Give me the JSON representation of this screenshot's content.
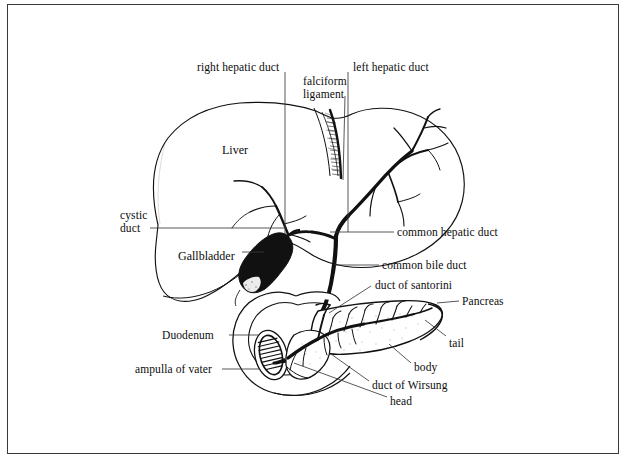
{
  "figure": {
    "border_color": "#3a3a3a",
    "background_color": "#ffffff",
    "ink_color": "#0c0c0c"
  },
  "organ_labels": [
    {
      "id": "liver",
      "text": "Liver",
      "x": 222,
      "y": 143
    },
    {
      "id": "gallbladder",
      "text": "Gallbladder",
      "x": 178,
      "y": 255
    }
  ],
  "annotations": [
    {
      "id": "right-hepatic-duct",
      "text": "right hepatic duct",
      "x": 197,
      "y": 61
    },
    {
      "id": "falciform-ligament-line1",
      "text": "falciform",
      "x": 303,
      "y": 75
    },
    {
      "id": "falciform-ligament-line2",
      "text": "ligament",
      "x": 303,
      "y": 88
    },
    {
      "id": "left-hepatic-duct",
      "text": "left hepatic duct",
      "x": 353,
      "y": 61
    },
    {
      "id": "cystic-duct-line1",
      "text": "cystic",
      "x": 120,
      "y": 209
    },
    {
      "id": "cystic-duct-line2",
      "text": "duct",
      "x": 120,
      "y": 222
    },
    {
      "id": "common-hepatic-duct",
      "text": "common hepatic duct",
      "x": 397,
      "y": 228
    },
    {
      "id": "common-bile-duct",
      "text": "common bile duct",
      "x": 382,
      "y": 261
    },
    {
      "id": "duct-of-santorini",
      "text": "duct of santorini",
      "x": 375,
      "y": 281
    },
    {
      "id": "pancreas",
      "text": "Pancreas",
      "x": 462,
      "y": 297
    },
    {
      "id": "duodenum",
      "text": "Duodenum",
      "x": 162,
      "y": 331
    },
    {
      "id": "tail",
      "text": "tail",
      "x": 449,
      "y": 339
    },
    {
      "id": "ampulla-of-vater",
      "text": "ampulla of vater",
      "x": 135,
      "y": 365
    },
    {
      "id": "body",
      "text": "body",
      "x": 414,
      "y": 368
    },
    {
      "id": "duct-of-wirsung",
      "text": "duct of Wirsung",
      "x": 372,
      "y": 385
    },
    {
      "id": "head",
      "text": "head",
      "x": 390,
      "y": 401
    }
  ],
  "structures": [
    "liver-outline",
    "falciform-ligament",
    "right-hepatic-duct",
    "left-hepatic-duct",
    "common-hepatic-duct",
    "cystic-duct",
    "gallbladder",
    "common-bile-duct",
    "duodenum",
    "ampulla-of-vater",
    "pancreas-head",
    "pancreas-body",
    "pancreas-tail",
    "duct-of-wirsung",
    "duct-of-santorini",
    "intrahepatic-biliary-tree"
  ],
  "leader_lines": [
    {
      "id": "right-hepatic-duct-leader",
      "x1": 285,
      "y1": 70,
      "x2": 285,
      "y2": 232
    },
    {
      "id": "falciform-ligament-leader",
      "x1": 345,
      "y1": 96,
      "x2": 345,
      "y2": 182
    },
    {
      "id": "left-hepatic-duct-leader",
      "x1": 348,
      "y1": 70,
      "x2": 348,
      "y2": 230
    },
    {
      "id": "cystic-duct-leader",
      "x1": 150,
      "y1": 228,
      "x2": 283,
      "y2": 228
    },
    {
      "id": "common-hepatic-duct-leader",
      "x1": 393,
      "y1": 232,
      "x2": 330,
      "y2": 232
    },
    {
      "id": "common-bile-duct-leader",
      "x1": 378,
      "y1": 265,
      "x2": 333,
      "y2": 265
    },
    {
      "id": "duct-of-santorini-leader",
      "x1": 372,
      "y1": 286,
      "x2": 329,
      "y2": 315
    },
    {
      "id": "pancreas-leader",
      "x1": 458,
      "y1": 301,
      "x2": 434,
      "y2": 301
    },
    {
      "id": "duodenum-leader",
      "x1": 228,
      "y1": 335,
      "x2": 260,
      "y2": 335
    },
    {
      "id": "tail-leader",
      "x1": 446,
      "y1": 337,
      "x2": 424,
      "y2": 321
    },
    {
      "id": "ampulla-of-vater-leader",
      "x1": 222,
      "y1": 369,
      "x2": 262,
      "y2": 369
    },
    {
      "id": "body-leader",
      "x1": 411,
      "y1": 364,
      "x2": 389,
      "y2": 345
    },
    {
      "id": "duct-of-wirsung-leader",
      "x1": 369,
      "y1": 382,
      "x2": 330,
      "y2": 355
    },
    {
      "id": "head-leader",
      "x1": 387,
      "y1": 398,
      "x2": 293,
      "y2": 363
    }
  ]
}
